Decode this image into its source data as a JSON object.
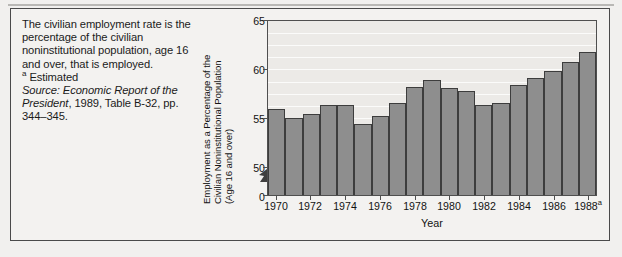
{
  "caption": {
    "paragraph": "The civilian employment rate is the percentage of the civilian noninstitutional population, age 16 and over, that is employed.",
    "footnote_marker": "a",
    "footnote_text": "Estimated",
    "source_label": "Source: Economic Report of the President",
    "source_rest": ", 1989, Table B-32, pp. 344–345."
  },
  "chart_data": {
    "type": "bar",
    "title": "",
    "xlabel": "Year",
    "ylabel": "Employment as a Percentage of the Civilian Noninstitutional Population (Age 16 and over)",
    "ylabel_lines": [
      "Employment as a Percentage of the",
      "Civilian Noninstitutional Population",
      "(Age 16 and over)"
    ],
    "categories": [
      "1970",
      "1971",
      "1972",
      "1973",
      "1974",
      "1975",
      "1976",
      "1977",
      "1978",
      "1979",
      "1980",
      "1981",
      "1982",
      "1983",
      "1984",
      "1985",
      "1986",
      "1987",
      "1988"
    ],
    "values": [
      57.4,
      56.6,
      57.0,
      57.8,
      57.8,
      56.1,
      56.8,
      57.9,
      59.3,
      59.9,
      59.2,
      59.0,
      57.8,
      57.9,
      59.5,
      60.1,
      60.7,
      61.5,
      62.3
    ],
    "value_labels": [],
    "ylim": [
      50,
      65
    ],
    "yticks": [
      "0",
      "50",
      "55",
      "60",
      "65"
    ],
    "ytick_values": [
      0,
      50,
      55,
      60,
      65
    ],
    "axis_break": true,
    "xticks_shown": [
      "1970",
      "1972",
      "1974",
      "1976",
      "1978",
      "1980",
      "1982",
      "1984",
      "1986",
      "1988"
    ],
    "last_tick_superscript": "a",
    "grid": "horizontal",
    "legend": "none",
    "bar_color": "#8e8e8e",
    "bar_border_color": "#3d3d3d",
    "plot_background": "#eceae7",
    "gridline_color": "#fbfbfa",
    "page_background": "#f1f0ee"
  }
}
